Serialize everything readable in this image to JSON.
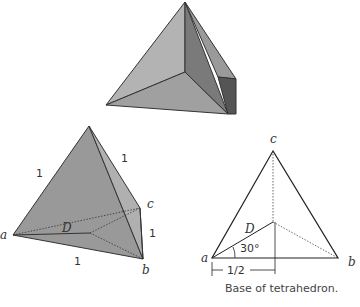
{
  "figure": {
    "top_solid": {
      "description": "shaded 3D tetrahedron"
    },
    "left_tetrahedron": {
      "vertex_labels": {
        "a": "a",
        "b": "b",
        "c": "c",
        "D": "D"
      },
      "edge_labels": {
        "left": "1",
        "right": "1",
        "cb": "1",
        "ab": "1"
      }
    },
    "base_diagram": {
      "vertex_labels": {
        "a": "a",
        "b": "b",
        "c": "c",
        "D": "D"
      },
      "angle_label": "30°",
      "half_label": "1/2",
      "caption": "Base of tetrahedron."
    },
    "colors": {
      "face_light": "#a8a8a8",
      "face_mid": "#8c8c8c",
      "face_dark": "#6e6e6e",
      "stroke": "#333333"
    }
  }
}
